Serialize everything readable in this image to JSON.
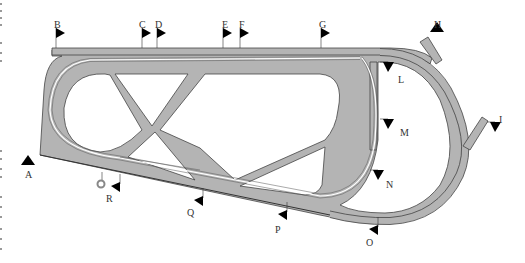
{
  "diagram": {
    "track_color": "#b4b4b4",
    "outline_color": "#444444",
    "flag_color": "#000000",
    "markers": [
      {
        "id": "A",
        "label": "A",
        "x": 28,
        "y": 165,
        "dir": "up"
      },
      {
        "id": "B",
        "label": "B",
        "x": 56,
        "y": 38,
        "dir": "right"
      },
      {
        "id": "C",
        "label": "C",
        "x": 142,
        "y": 38,
        "dir": "right"
      },
      {
        "id": "D",
        "label": "D",
        "x": 157,
        "y": 38,
        "dir": "right"
      },
      {
        "id": "E",
        "label": "E",
        "x": 223,
        "y": 38,
        "dir": "right"
      },
      {
        "id": "F",
        "label": "F",
        "x": 240,
        "y": 38,
        "dir": "right"
      },
      {
        "id": "G",
        "label": "G",
        "x": 321,
        "y": 38,
        "dir": "right"
      },
      {
        "id": "H",
        "label": "H",
        "x": 437,
        "y": 32,
        "dir": "up"
      },
      {
        "id": "I",
        "label": "I",
        "x": 495,
        "y": 130,
        "dir": "down"
      },
      {
        "id": "L",
        "label": "L",
        "x": 388,
        "y": 70,
        "dir": "down"
      },
      {
        "id": "M",
        "label": "M",
        "x": 388,
        "y": 127,
        "dir": "down"
      },
      {
        "id": "N",
        "label": "N",
        "x": 378,
        "y": 178,
        "dir": "down"
      },
      {
        "id": "O",
        "label": "O",
        "x": 378,
        "y": 229,
        "dir": "left"
      },
      {
        "id": "P",
        "label": "P",
        "x": 287,
        "y": 214,
        "dir": "left"
      },
      {
        "id": "Q",
        "label": "Q",
        "x": 203,
        "y": 200,
        "dir": "left"
      },
      {
        "id": "R",
        "label": "R",
        "x": 120,
        "y": 186,
        "dir": "left"
      }
    ],
    "labels": [
      {
        "text": "A",
        "x": 25,
        "y": 170
      },
      {
        "text": "B",
        "x": 54,
        "y": 20
      },
      {
        "text": "C",
        "x": 139,
        "y": 20
      },
      {
        "text": "D",
        "x": 155,
        "y": 20
      },
      {
        "text": "E",
        "x": 222,
        "y": 20
      },
      {
        "text": "F",
        "x": 239,
        "y": 20
      },
      {
        "text": "G",
        "x": 319,
        "y": 20
      },
      {
        "text": "H",
        "x": 434,
        "y": 20
      },
      {
        "text": "I",
        "x": 499,
        "y": 115
      },
      {
        "text": "L",
        "x": 398,
        "y": 75
      },
      {
        "text": "M",
        "x": 400,
        "y": 128
      },
      {
        "text": "N",
        "x": 386,
        "y": 180
      },
      {
        "text": "O",
        "x": 366,
        "y": 238
      },
      {
        "text": "P",
        "x": 275,
        "y": 225
      },
      {
        "text": "Q",
        "x": 187,
        "y": 208
      },
      {
        "text": "R",
        "x": 106,
        "y": 194
      }
    ],
    "ring_marker": {
      "name": "start-ring",
      "x": 100,
      "y": 184
    }
  }
}
